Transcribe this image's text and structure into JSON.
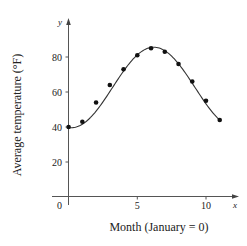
{
  "chart_data": {
    "type": "scatter",
    "title": "",
    "xlabel": "Month (January = 0)",
    "ylabel": "Average temperature (°F)",
    "x_axis_letter": "x",
    "y_axis_letter": "y",
    "xlim": [
      0,
      12
    ],
    "ylim": [
      0,
      95
    ],
    "x_ticks": [
      0,
      5,
      10
    ],
    "x_tick_labels": [
      "0",
      "5",
      "10"
    ],
    "y_ticks": [
      20,
      40,
      60,
      80
    ],
    "y_tick_labels": [
      "20",
      "40",
      "60",
      "80"
    ],
    "grid": false,
    "legend": null,
    "series": [
      {
        "name": "Monthly average temperature",
        "kind": "scatter",
        "x": [
          0,
          1,
          2,
          3,
          4,
          5,
          6,
          7,
          8,
          9,
          10,
          11
        ],
        "values": [
          40,
          43,
          54,
          64,
          73,
          81,
          85,
          83,
          76,
          66,
          55,
          44
        ]
      },
      {
        "name": "Sinusoidal model",
        "kind": "line",
        "model": {
          "form": "a + b*cos(c*(x - d))",
          "a": 62.6,
          "b": -23,
          "c": 0.5236,
          "d": 0.2
        },
        "x_range": [
          0,
          11
        ]
      }
    ]
  }
}
